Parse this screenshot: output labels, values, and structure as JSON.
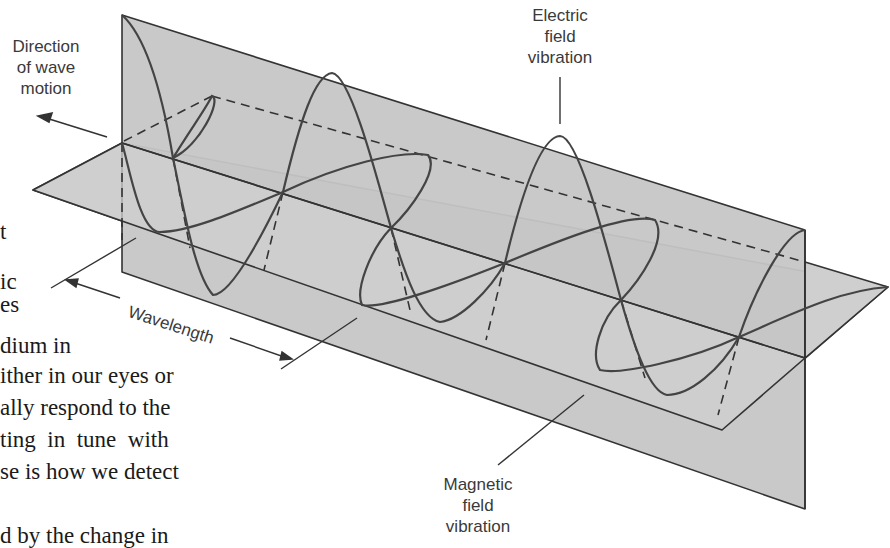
{
  "diagram": {
    "labels": {
      "direction": [
        "Direction",
        "of wave",
        "motion"
      ],
      "electric": [
        "Electric",
        "field",
        "vibration"
      ],
      "magnetic": [
        "Magnetic",
        "field",
        "vibration"
      ],
      "wavelength": "Wavelength"
    },
    "colors": {
      "plane_fill": "#c8c8c8",
      "plane_fill_light": "#d2d2d2",
      "line": "#333333",
      "wave": "#444444",
      "label_text": "#3a3a3a"
    }
  },
  "background_text": {
    "lines": [
      "t",
      "ic",
      "es",
      "dium in",
      "ither in our eyes or",
      "ally respond to the",
      "ting  in  tune  with",
      "se is how we detect",
      "d by the change in"
    ]
  }
}
